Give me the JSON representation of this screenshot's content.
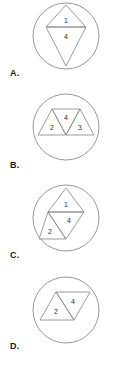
{
  "canvas": {
    "width": 126,
    "height": 374,
    "background": "#ffffff"
  },
  "style": {
    "stroke_color": "#8a8a8a",
    "number_color": "#2e2e2e",
    "label_color": "#1b1b1b",
    "fill": "none"
  },
  "options": [
    {
      "id": "option-a",
      "label": "A.",
      "label_x": 10,
      "label_y": 68,
      "circle": {
        "cx": 66,
        "cy": 36,
        "r": 33
      },
      "triangles": [
        {
          "number": "1",
          "orientation": "up",
          "points": "66,5 86,27 46,27",
          "num_x": 66,
          "num_y": 21
        },
        {
          "number": "4",
          "orientation": "down",
          "points": "46,27 86,27 66,66",
          "num_x": 66,
          "num_y": 37
        }
      ]
    },
    {
      "id": "option-b",
      "label": "B.",
      "label_x": 10,
      "label_y": 160,
      "circle": {
        "cx": 66,
        "cy": 127,
        "r": 33
      },
      "triangles": [
        {
          "number": "2",
          "orientation": "up",
          "points": "52,109 66,135 38,135",
          "num_x": 52,
          "num_y": 128
        },
        {
          "number": "4",
          "orientation": "down",
          "points": "52,109 80,109 66,135",
          "num_x": 66,
          "num_y": 118
        },
        {
          "number": "3",
          "orientation": "up",
          "points": "80,109 94,135 66,135",
          "num_x": 80,
          "num_y": 128
        }
      ]
    },
    {
      "id": "option-c",
      "label": "C.",
      "label_x": 10,
      "label_y": 250,
      "circle": {
        "cx": 66,
        "cy": 218,
        "r": 33
      },
      "triangles": [
        {
          "number": "1",
          "orientation": "up",
          "points": "66,188 84,212 48,212",
          "num_x": 66,
          "num_y": 205
        },
        {
          "number": "4",
          "orientation": "down",
          "points": "48,212 84,212 66,239",
          "num_x": 69,
          "num_y": 221
        },
        {
          "number": "2",
          "orientation": "up",
          "points": "48,212 66,239 39,239",
          "num_x": 50,
          "num_y": 232
        }
      ]
    },
    {
      "id": "option-d",
      "label": "D.",
      "label_x": 10,
      "label_y": 341,
      "circle": {
        "cx": 66,
        "cy": 310,
        "r": 33
      },
      "triangles": [
        {
          "number": "2",
          "orientation": "up",
          "points": "56,292 74,320 40,320",
          "num_x": 56,
          "num_y": 312
        },
        {
          "number": "4",
          "orientation": "down",
          "points": "56,292 90,292 74,320",
          "num_x": 73,
          "num_y": 302
        }
      ]
    }
  ]
}
